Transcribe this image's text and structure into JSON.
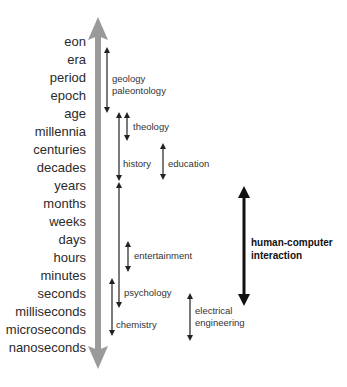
{
  "scale": {
    "labels": [
      "eon",
      "era",
      "period",
      "epoch",
      "age",
      "millennia",
      "centuries",
      "decades",
      "years",
      "months",
      "weeks",
      "days",
      "hours",
      "minutes",
      "seconds",
      "milliseconds",
      "microseconds",
      "nanoseconds"
    ],
    "axis_color": "#9a9a9a"
  },
  "disciplines": [
    {
      "name": "geology paleontology",
      "lines": [
        "geology",
        "paleontology"
      ],
      "from": "eon",
      "to": "age"
    },
    {
      "name": "theology",
      "lines": [
        "theology"
      ],
      "from": "age",
      "to": "centuries"
    },
    {
      "name": "history",
      "lines": [
        "history"
      ],
      "from": "age",
      "to": "years"
    },
    {
      "name": "education",
      "lines": [
        "education"
      ],
      "from": "centuries",
      "to": "years"
    },
    {
      "name": "entertainment",
      "lines": [
        "entertainment"
      ],
      "from": "days",
      "to": "minutes"
    },
    {
      "name": "psychology",
      "lines": [
        "psychology"
      ],
      "from": "years",
      "to": "milliseconds"
    },
    {
      "name": "chemistry",
      "lines": [
        "chemistry"
      ],
      "from": "seconds",
      "to": "nanoseconds"
    },
    {
      "name": "electrical engineering",
      "lines": [
        "electrical",
        "engineering"
      ],
      "from": "milliseconds",
      "to": "nanoseconds"
    },
    {
      "name": "human-computer interaction",
      "lines": [
        "human-computer",
        "interaction"
      ],
      "from": "months",
      "to": "milliseconds",
      "emphasis": true
    }
  ]
}
